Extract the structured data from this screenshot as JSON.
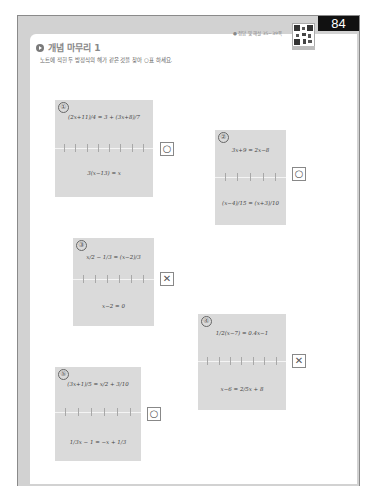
{
  "page": {
    "number": "84",
    "answer_ref": "● 정답 및 해설 35~39쪽",
    "title": "개념 마무리 1",
    "instruction": "노트에 적힌 두 방정식의 해가 같은 것을 찾아 ○표 하세요."
  },
  "problems": [
    {
      "label": "①",
      "top_equation": "(2x+11)/4 = 3 + (3x+8)/7",
      "bottom_equation": "3(x−13) = x",
      "mark": "○",
      "mark_type": "circle"
    },
    {
      "label": "②",
      "top_equation": "3x+9 = 2x−8",
      "bottom_equation": "(x−4)/15 = (x+3)/10",
      "mark": "○",
      "mark_type": "circle"
    },
    {
      "label": "③",
      "top_equation": "x/2 − 1/3 = (x−2)/3",
      "bottom_equation": "x−2 = 0",
      "mark": "✕",
      "mark_type": "cross"
    },
    {
      "label": "④",
      "top_equation": "1/2(x−7) = 0.4x−1",
      "bottom_equation": "x−6 = 2/5x + 8",
      "mark": "✕",
      "mark_type": "cross"
    },
    {
      "label": "⑤",
      "top_equation": "(3x+1)/5 = x/2 + 3/10",
      "bottom_equation": "1/3x − 1 = −x + 1/3",
      "mark": "○",
      "mark_type": "circle"
    }
  ]
}
